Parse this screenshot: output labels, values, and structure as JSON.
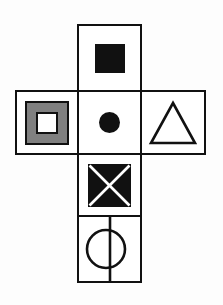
{
  "figure": {
    "background_color": "#fdfdfd",
    "stroke_color": "#111111",
    "fill_gray": "#808080",
    "fill_white": "#ffffff",
    "layout": "cross",
    "cells": [
      {
        "position": "top",
        "icon_name": "filled-square-icon",
        "description": "solid black square",
        "fill": "#111111",
        "outlined": false
      },
      {
        "position": "middle-left",
        "icon_name": "concentric-squares-icon",
        "description": "gray square containing white square, both black outlined",
        "fill": "#808080",
        "inner_fill": "#ffffff",
        "outlined": true
      },
      {
        "position": "middle-center",
        "icon_name": "filled-circle-icon",
        "description": "solid black circle",
        "fill": "#111111",
        "outlined": false
      },
      {
        "position": "middle-right",
        "icon_name": "outline-triangle-icon",
        "description": "unfilled triangle with apex at top",
        "fill": "none",
        "outlined": true
      },
      {
        "position": "lower-center",
        "icon_name": "crossed-square-icon",
        "description": "solid black square with white diagonal X",
        "fill": "#111111",
        "cross_color": "#ffffff",
        "outlined": false
      },
      {
        "position": "bottom",
        "icon_name": "circle-with-vertical-line-icon",
        "description": "unfilled circle bisected by a full-height vertical line",
        "fill": "none",
        "outlined": true
      }
    ]
  }
}
